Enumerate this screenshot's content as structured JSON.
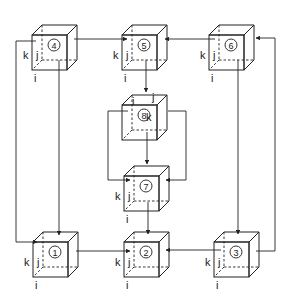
{
  "diagram": {
    "type": "cube-network",
    "axis_labels": {
      "i": "i",
      "j": "j",
      "k": "k"
    },
    "nodes": [
      {
        "id": "1",
        "label": "①",
        "x": 33,
        "y": 232
      },
      {
        "id": "2",
        "label": "②",
        "x": 124,
        "y": 232
      },
      {
        "id": "3",
        "label": "③",
        "x": 214,
        "y": 232
      },
      {
        "id": "4",
        "label": "④",
        "x": 32,
        "y": 25
      },
      {
        "id": "5",
        "label": "⑤",
        "x": 122,
        "y": 25
      },
      {
        "id": "6",
        "label": "⑥",
        "x": 209,
        "y": 25
      },
      {
        "id": "7",
        "label": "⑦",
        "x": 124,
        "y": 166
      },
      {
        "id": "8",
        "label": "⑧",
        "x": 122,
        "y": 95
      }
    ],
    "edges": [
      {
        "from": "4",
        "to": "1",
        "route": "left-loop"
      },
      {
        "from": "4",
        "to": "1",
        "route": "bottom-down"
      },
      {
        "from": "5",
        "to": "4"
      },
      {
        "from": "6",
        "to": "5"
      },
      {
        "from": "5",
        "to": "8"
      },
      {
        "from": "8",
        "to": "7"
      },
      {
        "from": "8",
        "to": "7",
        "route": "left-loop"
      },
      {
        "from": "8",
        "to": "7",
        "route": "right-loop"
      },
      {
        "from": "7",
        "to": "2"
      },
      {
        "from": "1",
        "to": "2"
      },
      {
        "from": "3",
        "to": "2"
      },
      {
        "from": "6",
        "to": "3",
        "route": "bottom-down"
      },
      {
        "from": "3",
        "to": "6",
        "route": "right-loop"
      }
    ]
  }
}
